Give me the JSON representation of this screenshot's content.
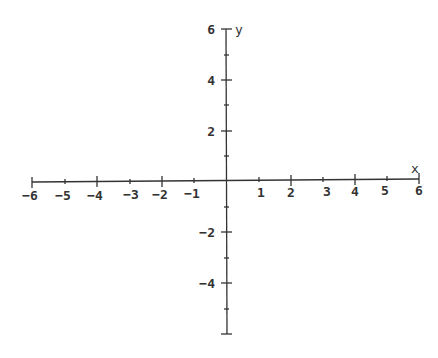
{
  "diagram": {
    "type": "cartesian-coordinate-plane",
    "x_axis": {
      "label": "x",
      "range": [
        -6,
        6
      ],
      "major_tick_labels": [
        "-6",
        "-5",
        "-4",
        "-3",
        "-2",
        "-1",
        "1",
        "2",
        "3",
        "4",
        "5",
        "6"
      ]
    },
    "y_axis": {
      "label": "y",
      "range": [
        -6,
        6
      ],
      "major_tick_labels": [
        "6",
        "4",
        "2",
        "-2",
        "-4"
      ]
    },
    "colors": {
      "axis": "#333333",
      "background": "#ffffff"
    }
  },
  "labels": {
    "x": "x",
    "y": "y",
    "xm6": "−6",
    "xm5": "−5",
    "xm4": "−4",
    "xm3": "−3",
    "xm2": "−2",
    "xm1": "−1",
    "x1": "1",
    "x2": "2",
    "x3": "3",
    "x4": "4",
    "x5": "5",
    "x6": "6",
    "y6": "6",
    "y4": "4",
    "y2": "2",
    "ym2": "−2",
    "ym4": "−4"
  }
}
